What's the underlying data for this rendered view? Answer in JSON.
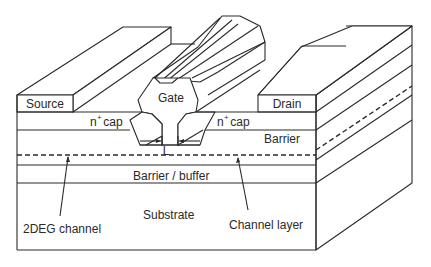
{
  "figure": {
    "labels": {
      "source": "Source",
      "gate": "Gate",
      "drain": "Drain",
      "ncap_left_base": "n",
      "ncap_left_sup": "+",
      "ncap_left_rest": " cap",
      "ncap_right_base": "n",
      "ncap_right_sup": "+",
      "ncap_right_rest": " cap",
      "barrier": "Barrier",
      "gate_length": "L",
      "barrier_buffer": "Barrier / buffer",
      "substrate": "Substrate",
      "twodeg_channel": "2DEG channel",
      "channel_layer": "Channel layer"
    },
    "colors": {
      "line": "#2a2a2a",
      "background": "#ffffff"
    }
  }
}
